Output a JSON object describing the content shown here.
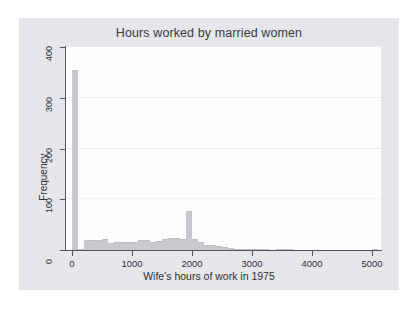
{
  "figure": {
    "title": "Hours worked by married women",
    "background_color": "#e8e8ec",
    "plot_background_color": "#ffffff",
    "bar_color": "#c9c9cf",
    "axis_color": "#55555d",
    "grid_color": "#eef0f3"
  },
  "chart_data": {
    "type": "bar",
    "title": "Hours worked by married women",
    "subtitle": "",
    "xlabel": "Wife's hours of work in 1975",
    "ylabel": "Frequency",
    "xlim": [
      -100,
      5150
    ],
    "ylim": [
      0,
      400
    ],
    "xticks": [
      0,
      1000,
      2000,
      3000,
      4000,
      5000
    ],
    "xtick_labels": [
      "0",
      "1000",
      "2000",
      "3000",
      "4000",
      "5000"
    ],
    "yticks": [
      0,
      100,
      200,
      300,
      400
    ],
    "ytick_labels": [
      "0",
      "100",
      "200",
      "300",
      "400"
    ],
    "grid": "horizontal",
    "legend": "none",
    "bin_width": 100,
    "bin_starts": [
      0,
      100,
      200,
      300,
      400,
      500,
      600,
      700,
      800,
      900,
      1000,
      1100,
      1200,
      1300,
      1400,
      1500,
      1600,
      1700,
      1800,
      1900,
      2000,
      2100,
      2200,
      2300,
      2400,
      2500,
      2600,
      2700,
      2800,
      2900,
      3000,
      3100,
      3200,
      3300,
      3400,
      3500,
      3600,
      3700,
      3800,
      3900,
      4000,
      4100,
      4200,
      4300,
      4400,
      4500,
      4600,
      4700,
      4800,
      4900,
      5000
    ],
    "categories": [
      "0-100",
      "100-200",
      "200-300",
      "300-400",
      "400-500",
      "500-600",
      "600-700",
      "700-800",
      "800-900",
      "900-1000",
      "1000-1100",
      "1100-1200",
      "1200-1300",
      "1300-1400",
      "1400-1500",
      "1500-1600",
      "1600-1700",
      "1700-1800",
      "1800-1900",
      "1900-2000",
      "2000-2100",
      "2100-2200",
      "2200-2300",
      "2300-2400",
      "2400-2500",
      "2500-2600",
      "2600-2700",
      "2700-2800",
      "2800-2900",
      "2900-3000",
      "3000-3100",
      "3100-3200",
      "3200-3300",
      "3300-3400",
      "3400-3500",
      "3500-3600",
      "3600-3700",
      "3700-3800",
      "3800-3900",
      "3900-4000",
      "4000-4100",
      "4100-4200",
      "4200-4300",
      "4300-4400",
      "4400-4500",
      "4500-4600",
      "4600-4700",
      "4700-4800",
      "4800-4900",
      "4900-5000",
      "5000-5100"
    ],
    "values": [
      355,
      2,
      20,
      20,
      20,
      21,
      14,
      15,
      15,
      16,
      16,
      19,
      19,
      16,
      17,
      22,
      24,
      24,
      21,
      77,
      21,
      15,
      9,
      10,
      7,
      6,
      4,
      2,
      1,
      1,
      1,
      1,
      1,
      0,
      1,
      2,
      1,
      0,
      0,
      0,
      0,
      0,
      0,
      0,
      0,
      0,
      0,
      0,
      0,
      0,
      1
    ],
    "peak_zero_count": 355,
    "peak_fulltime_count": 77
  }
}
